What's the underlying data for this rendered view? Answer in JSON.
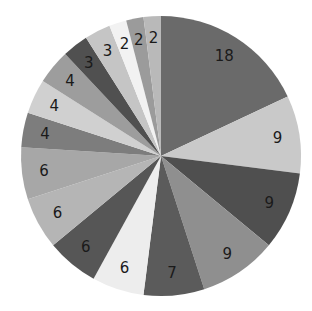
{
  "chart_data": {
    "type": "pie",
    "title": "",
    "start_angle": "12 o'clock",
    "direction": "clockwise",
    "values": [
      18,
      9,
      9,
      9,
      7,
      6,
      6,
      6,
      6,
      4,
      4,
      4,
      3,
      3,
      2,
      2,
      2
    ],
    "labels": [
      "18",
      "9",
      "9",
      "9",
      "7",
      "6",
      "6",
      "6",
      "6",
      "4",
      "4",
      "4",
      "3",
      "3",
      "2",
      "2",
      "2"
    ],
    "colors": [
      "#6a6a6a",
      "#c9c9c9",
      "#4f4f4f",
      "#8f8f8f",
      "#5b5b5b",
      "#ededed",
      "#565656",
      "#b5b5b5",
      "#a7a7a7",
      "#7d7d7d",
      "#d0d0d0",
      "#9d9d9d",
      "#505050",
      "#c5c5c5",
      "#f2f2f2",
      "#9b9b9b",
      "#b9b9b9"
    ],
    "legend": "none"
  }
}
